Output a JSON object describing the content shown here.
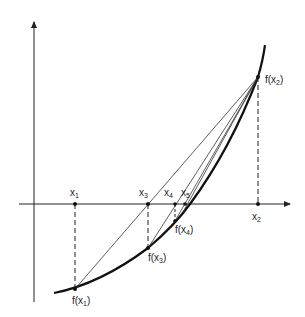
{
  "diagram": {
    "colors": {
      "stroke": "#222222",
      "background": "#ffffff"
    },
    "axes": {
      "x_axis": {
        "label": "",
        "arrow": true
      },
      "y_axis": {
        "label": "",
        "arrow": true
      }
    },
    "points": {
      "x1": {
        "name": "x",
        "sub": "1"
      },
      "x2": {
        "name": "x",
        "sub": "2"
      },
      "x3": {
        "name": "x",
        "sub": "3"
      },
      "x4": {
        "name": "x",
        "sub": "4"
      },
      "x5": {
        "name": "x",
        "sub": "5"
      }
    },
    "function_values": {
      "fx1": {
        "prefix": "f(x",
        "sub": "1",
        "suffix": ")"
      },
      "fx2": {
        "prefix": "f(x",
        "sub": "2",
        "suffix": ")"
      },
      "fx3": {
        "prefix": "f(x",
        "sub": "3",
        "suffix": ")"
      },
      "fx4": {
        "prefix": "f(x",
        "sub": "4",
        "suffix": ")"
      }
    },
    "secants": [
      {
        "from": "f(x1)",
        "to": "f(x2)",
        "crosses_at": "x3"
      },
      {
        "from": "f(x3)",
        "to": "f(x2)",
        "crosses_at": "x4"
      },
      {
        "from": "f(x4)",
        "to": "f(x2)",
        "crosses_at": "x5"
      }
    ]
  }
}
